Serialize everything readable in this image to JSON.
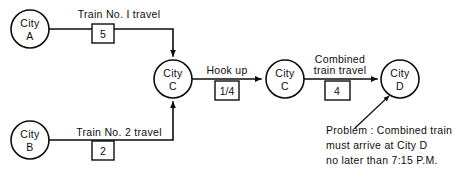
{
  "diagram": {
    "type": "network-arrow-diagram",
    "background_color": "#ffffff",
    "line_color": "#0d0d0d",
    "nodes": [
      {
        "id": "A",
        "line1": "City",
        "line2": "A"
      },
      {
        "id": "C1",
        "line1": "City",
        "line2": "C"
      },
      {
        "id": "B",
        "line1": "City",
        "line2": "B"
      },
      {
        "id": "C2",
        "line1": "City",
        "line2": "C"
      },
      {
        "id": "D",
        "line1": "City",
        "line2": "D"
      }
    ],
    "edges": [
      {
        "id": "a-to-c",
        "label": "Train  No. I  travel",
        "duration": "5"
      },
      {
        "id": "b-to-c",
        "label": "Train  No. 2  travel",
        "duration": "2"
      },
      {
        "id": "hookup",
        "label": "Hook  up",
        "duration": "1/4"
      },
      {
        "id": "combined",
        "label_line1": "Combined",
        "label_line2": "train  travel",
        "duration": "4"
      }
    ],
    "annotation": {
      "line1": "Problem : Combined  train",
      "line2": "must  arrive  at  City  D",
      "line3": "no  later  than  7:15  P.M."
    }
  }
}
